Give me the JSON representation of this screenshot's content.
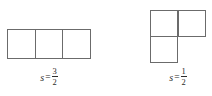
{
  "figure": {
    "background_color": "#ffffff",
    "stroke_color": "#6b6b6b",
    "text_color": "#2b2b2b",
    "shapes": [
      {
        "id": "straight-tromino",
        "name": "left-shape",
        "description": "three unit squares in a horizontal row",
        "cell_count": 3,
        "cells": [
          {
            "col": 0,
            "row": 0
          },
          {
            "col": 1,
            "row": 0
          },
          {
            "col": 2,
            "row": 0
          }
        ],
        "label": {
          "variable": "s",
          "equals": "=",
          "numerator": "3",
          "denominator": "2",
          "value_text": "s = 3/2"
        }
      },
      {
        "id": "l-tromino",
        "name": "right-shape",
        "description": "L-shaped tromino: two squares on top row, one square below the left square",
        "cell_count": 3,
        "cells": [
          {
            "col": 0,
            "row": 0
          },
          {
            "col": 1,
            "row": 0
          },
          {
            "col": 0,
            "row": 1
          }
        ],
        "label": {
          "variable": "s",
          "equals": "=",
          "numerator": "1",
          "denominator": "2",
          "value_text": "s = 1/2"
        }
      }
    ]
  }
}
